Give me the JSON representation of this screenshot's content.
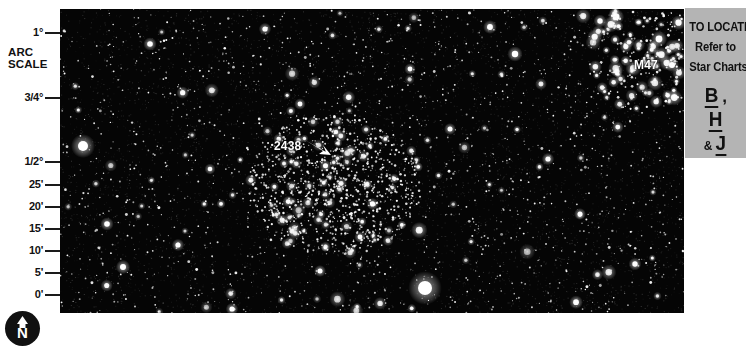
{
  "scale": {
    "title_line1": "ARC",
    "title_line2": "SCALE",
    "ticks": [
      {
        "label": "1°",
        "y": 27
      },
      {
        "label": "3/4°",
        "y": 92
      },
      {
        "label": "1/2°",
        "y": 156
      },
      {
        "label": "25'",
        "y": 179
      },
      {
        "label": "20'",
        "y": 201
      },
      {
        "label": "15'",
        "y": 223
      },
      {
        "label": "10'",
        "y": 245
      },
      {
        "label": "5'",
        "y": 267
      },
      {
        "label": "0'",
        "y": 289
      }
    ]
  },
  "compass": {
    "direction": "N",
    "icon": "north-arrow-icon"
  },
  "star_field": {
    "labels": [
      {
        "name": "ngc-2438",
        "text": "2438"
      },
      {
        "name": "m47",
        "text": "M47"
      }
    ],
    "arrow_icon": "pointer-arrow-icon",
    "background_color": "#050505"
  },
  "locate_panel": {
    "line1": "TO LOCATE",
    "line2": "Refer to",
    "line3": "Star Charts",
    "charts": [
      {
        "letter": "B",
        "suffix": ",",
        "prefix": ""
      },
      {
        "letter": "H",
        "suffix": "",
        "prefix": ""
      },
      {
        "letter": "J",
        "suffix": "",
        "prefix": "&"
      }
    ],
    "background_color": "#b4b4b4"
  }
}
